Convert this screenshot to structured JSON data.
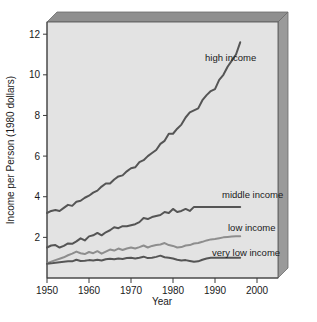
{
  "chart_data": {
    "type": "line",
    "title": "",
    "xlabel": "Year",
    "ylabel": "Income per Person (1980 dollars)",
    "xlim": [
      1950,
      2005
    ],
    "ylim": [
      0,
      12.6
    ],
    "grid": false,
    "legend_position": "inline-right-labels",
    "xticks": [
      "1950",
      "1960",
      "1970",
      "1980",
      "1990",
      "2000"
    ],
    "xtick_values": [
      1950,
      1960,
      1970,
      1980,
      1990,
      2000
    ],
    "yticks": [
      "2",
      "4",
      "6",
      "8",
      "10",
      "12"
    ],
    "ytick_values": [
      2,
      4,
      6,
      8,
      10,
      12
    ],
    "series": [
      {
        "name": "high income",
        "color": "#555555",
        "label": "high income",
        "x": [
          1950,
          1951,
          1952,
          1953,
          1954,
          1955,
          1956,
          1957,
          1958,
          1959,
          1960,
          1961,
          1962,
          1963,
          1964,
          1965,
          1966,
          1967,
          1968,
          1969,
          1970,
          1971,
          1972,
          1973,
          1974,
          1975,
          1976,
          1977,
          1978,
          1979,
          1980,
          1981,
          1982,
          1983,
          1984,
          1985,
          1986,
          1987,
          1988,
          1989,
          1990,
          1991,
          1992,
          1993,
          1994,
          1995,
          1996
        ],
        "values": [
          3.2,
          3.3,
          3.35,
          3.3,
          3.45,
          3.6,
          3.55,
          3.75,
          3.8,
          3.95,
          4.05,
          4.2,
          4.3,
          4.5,
          4.65,
          4.65,
          4.85,
          5.0,
          5.05,
          5.25,
          5.4,
          5.45,
          5.7,
          5.8,
          6.0,
          6.15,
          6.3,
          6.6,
          6.75,
          7.1,
          7.1,
          7.35,
          7.55,
          7.9,
          8.15,
          8.25,
          8.35,
          8.75,
          9.0,
          9.2,
          9.3,
          9.75,
          10.0,
          10.4,
          10.7,
          11.0,
          11.6
        ]
      },
      {
        "name": "middle income",
        "color": "#555555",
        "label": "middle income",
        "x": [
          1950,
          1951,
          1952,
          1953,
          1954,
          1955,
          1956,
          1957,
          1958,
          1959,
          1960,
          1961,
          1962,
          1963,
          1964,
          1965,
          1966,
          1967,
          1968,
          1969,
          1970,
          1971,
          1972,
          1973,
          1974,
          1975,
          1976,
          1977,
          1978,
          1979,
          1980,
          1981,
          1982,
          1983,
          1984,
          1985,
          1986,
          1987,
          1988,
          1989,
          1990,
          1991,
          1992,
          1993,
          1994,
          1995,
          1996
        ],
        "values": [
          1.5,
          1.6,
          1.62,
          1.5,
          1.58,
          1.7,
          1.68,
          1.8,
          1.95,
          1.85,
          2.05,
          2.1,
          2.22,
          2.1,
          2.25,
          2.35,
          2.5,
          2.45,
          2.55,
          2.55,
          2.6,
          2.65,
          2.75,
          2.95,
          2.9,
          3.0,
          3.05,
          3.1,
          3.25,
          3.2,
          3.4,
          3.25,
          3.3,
          3.4,
          3.3,
          3.5,
          3.5,
          3.5,
          3.5,
          3.5,
          3.5,
          3.5,
          3.5,
          3.5,
          3.5,
          3.5,
          3.5
        ]
      },
      {
        "name": "low income",
        "color": "#8e8e8e",
        "label": "low income",
        "x": [
          1950,
          1951,
          1952,
          1953,
          1954,
          1955,
          1956,
          1957,
          1958,
          1959,
          1960,
          1961,
          1962,
          1963,
          1964,
          1965,
          1966,
          1967,
          1968,
          1969,
          1970,
          1971,
          1972,
          1973,
          1974,
          1975,
          1976,
          1977,
          1978,
          1979,
          1980,
          1981,
          1982,
          1983,
          1984,
          1985,
          1986,
          1987,
          1988,
          1989,
          1990,
          1991,
          1992,
          1993,
          1994,
          1995,
          1996
        ],
        "values": [
          0.72,
          0.8,
          0.88,
          0.95,
          1.02,
          1.12,
          1.2,
          1.3,
          1.22,
          1.18,
          1.28,
          1.22,
          1.32,
          1.2,
          1.3,
          1.4,
          1.35,
          1.45,
          1.38,
          1.45,
          1.5,
          1.45,
          1.52,
          1.6,
          1.5,
          1.58,
          1.62,
          1.65,
          1.72,
          1.62,
          1.58,
          1.5,
          1.52,
          1.6,
          1.62,
          1.7,
          1.72,
          1.78,
          1.85,
          1.9,
          1.92,
          1.96,
          2.0,
          2.02,
          2.04,
          2.05,
          2.05
        ]
      },
      {
        "name": "very low income",
        "color": "#555555",
        "label": "very low income",
        "x": [
          1950,
          1951,
          1952,
          1953,
          1954,
          1955,
          1956,
          1957,
          1958,
          1959,
          1960,
          1961,
          1962,
          1963,
          1964,
          1965,
          1966,
          1967,
          1968,
          1969,
          1970,
          1971,
          1972,
          1973,
          1974,
          1975,
          1976,
          1977,
          1978,
          1979,
          1980,
          1981,
          1982,
          1983,
          1984,
          1985,
          1986,
          1987,
          1988,
          1989,
          1990,
          1991,
          1992,
          1993,
          1994,
          1995,
          1996
        ],
        "values": [
          0.7,
          0.72,
          0.75,
          0.78,
          0.8,
          0.82,
          0.82,
          0.9,
          0.84,
          0.85,
          0.88,
          0.86,
          0.9,
          0.86,
          0.92,
          0.95,
          0.92,
          0.96,
          0.94,
          0.98,
          1.0,
          0.96,
          1.0,
          1.05,
          0.98,
          1.0,
          1.04,
          1.1,
          1.02,
          1.0,
          0.96,
          0.9,
          0.86,
          0.88,
          0.84,
          0.8,
          0.82,
          0.9,
          0.96,
          1.0,
          1.0,
          1.0,
          1.0,
          1.0,
          1.0,
          1.0,
          1.0
        ]
      }
    ],
    "colors": {
      "plot_background": "#e3e3e3",
      "top_face": "#8f8f8f",
      "side_face": "#9a9a9a",
      "axis": "#3a3a3a",
      "dark_line": "#555555",
      "light_line": "#8e8e8e"
    }
  }
}
